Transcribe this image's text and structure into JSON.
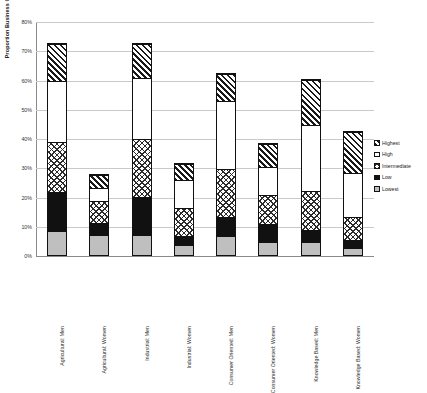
{
  "chart_data": {
    "type": "bar",
    "stacked": true,
    "title": "",
    "xlabel": "",
    "ylabel": "Proportion Business Creation by Sector",
    "ylim": [
      0,
      80
    ],
    "ytick_labels": [
      "80%",
      "70%",
      "60%",
      "50%",
      "40%",
      "30%",
      "20%",
      "10%",
      "0%"
    ],
    "ytick_values": [
      80,
      70,
      60,
      50,
      40,
      30,
      20,
      10,
      0
    ],
    "grid": true,
    "legend_position": "right",
    "categories": [
      "Agricultural: Men",
      "Agricultural: Women",
      "Industrial: Men",
      "Industrial: Women",
      "Consumer Oriented: Men",
      "Consumer Oriented: Women",
      "Knowledge Based: Men",
      "Knowledge Based: Women"
    ],
    "series": [
      {
        "name": "Lowest",
        "pattern": "light-gray-solid",
        "values": [
          8.0,
          6.5,
          6.5,
          3.0,
          6.0,
          4.0,
          4.0,
          2.0
        ]
      },
      {
        "name": "Low",
        "pattern": "black-solid",
        "values": [
          13.5,
          4.5,
          13.5,
          3.5,
          7.0,
          6.5,
          4.5,
          3.0
        ]
      },
      {
        "name": "Intermediate",
        "pattern": "checkerboard",
        "values": [
          17.0,
          7.5,
          19.5,
          9.5,
          16.5,
          10.0,
          13.5,
          8.0
        ]
      },
      {
        "name": "High",
        "pattern": "white-open",
        "values": [
          21.0,
          4.5,
          21.0,
          9.5,
          23.0,
          9.5,
          22.5,
          15.0
        ]
      },
      {
        "name": "Highest",
        "pattern": "diagonal-hatch",
        "values": [
          12.5,
          4.5,
          11.5,
          5.5,
          9.5,
          8.0,
          15.5,
          14.0
        ]
      }
    ],
    "series_order_bottom_to_top": [
      "Lowest",
      "Low",
      "Intermediate",
      "High",
      "Highest"
    ],
    "totals": [
      72.0,
      27.5,
      72.0,
      31.0,
      62.0,
      38.0,
      60.0,
      42.0
    ]
  },
  "legend": {
    "items": [
      {
        "label": "Highest"
      },
      {
        "label": "High"
      },
      {
        "label": "Intermediate"
      },
      {
        "label": "Low"
      },
      {
        "label": "Lowest"
      }
    ]
  }
}
